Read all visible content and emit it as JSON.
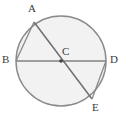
{
  "figure": {
    "background_color": "#ffffff",
    "circle_fill": "#f2f2f2",
    "stroke_color": "#808080",
    "label_color": "#3a3a3a",
    "circle": {
      "center_x": 61,
      "center_y": 61,
      "radius": 45
    },
    "points": [
      {
        "id": "A",
        "label": "A",
        "x": 34,
        "y": 22,
        "label_x": 28,
        "label_y": 4
      },
      {
        "id": "B",
        "label": "B",
        "x": 16,
        "y": 61,
        "label_x": 2,
        "label_y": 54
      },
      {
        "id": "C",
        "label": "C",
        "x": 61,
        "y": 61,
        "label_x": 62,
        "label_y": 46
      },
      {
        "id": "D",
        "label": "D",
        "x": 106,
        "y": 61,
        "label_x": 110,
        "label_y": 54
      },
      {
        "id": "E",
        "label": "E",
        "x": 92,
        "y": 99,
        "label_x": 92,
        "label_y": 102
      }
    ],
    "segments": [
      {
        "name": "diameter-BD",
        "from": "B",
        "to": "D"
      },
      {
        "name": "diameter-AE",
        "from": "A",
        "to": "E"
      },
      {
        "name": "chord-AB",
        "from": "A",
        "to": "B"
      },
      {
        "name": "chord-DE",
        "from": "D",
        "to": "E"
      }
    ],
    "center_dot": {
      "x": 61,
      "y": 61,
      "r": 1.8
    }
  }
}
